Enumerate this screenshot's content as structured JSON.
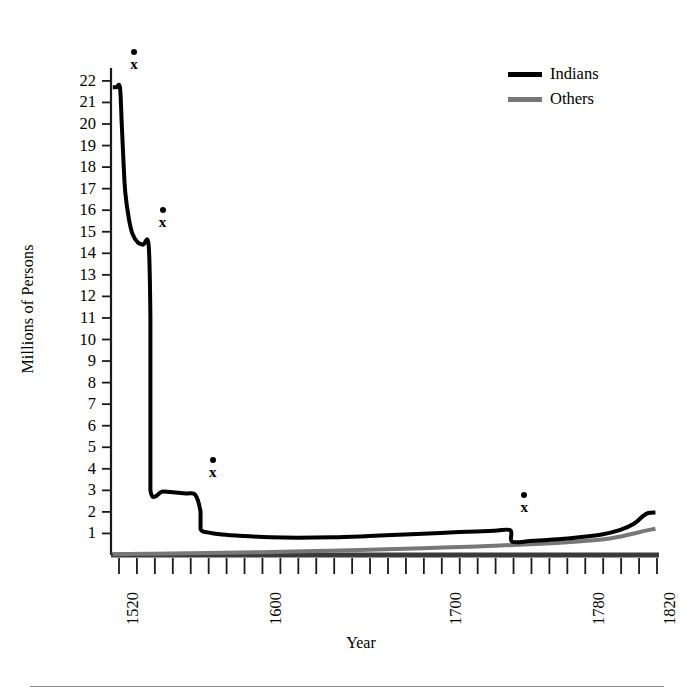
{
  "chart_data": {
    "type": "line",
    "title": "",
    "xlabel": "Year",
    "ylabel": "Millions of Persons",
    "xlim": [
      1516,
      1822
    ],
    "ylim": [
      0,
      22.6
    ],
    "grid": false,
    "legend_position": "top-right",
    "x_tick_labels": [
      "1520",
      "1600",
      "1700",
      "1780",
      "1820"
    ],
    "x_tick_values": [
      1520,
      1600,
      1700,
      1780,
      1820
    ],
    "y_tick_labels": [
      "1",
      "2",
      "3",
      "4",
      "5",
      "6",
      "7",
      "8",
      "9",
      "10",
      "11",
      "12",
      "13",
      "14",
      "15",
      "16",
      "17",
      "18",
      "19",
      "20",
      "21",
      "22"
    ],
    "y_tick_values": [
      1,
      2,
      3,
      4,
      5,
      6,
      7,
      8,
      9,
      10,
      11,
      12,
      13,
      14,
      15,
      16,
      17,
      18,
      19,
      20,
      21,
      22
    ],
    "minor_x_ticks_count": 31,
    "series": [
      {
        "name": "Indians",
        "color": "#000000",
        "width": 4,
        "points": [
          [
            1517,
            21.7
          ],
          [
            1519,
            21.7
          ],
          [
            1521,
            21.7
          ],
          [
            1522,
            20.0
          ],
          [
            1523,
            18.2
          ],
          [
            1524,
            16.8
          ],
          [
            1526,
            15.6
          ],
          [
            1528,
            14.9
          ],
          [
            1531,
            14.5
          ],
          [
            1534,
            14.4
          ],
          [
            1537,
            14.4
          ],
          [
            1538,
            11.0
          ],
          [
            1538,
            7.0
          ],
          [
            1538,
            3.0
          ],
          [
            1545,
            2.95
          ],
          [
            1552,
            2.9
          ],
          [
            1558,
            2.85
          ],
          [
            1563,
            2.8
          ],
          [
            1566,
            2.0
          ],
          [
            1566,
            1.2
          ],
          [
            1570,
            1.05
          ],
          [
            1578,
            0.95
          ],
          [
            1590,
            0.88
          ],
          [
            1605,
            0.82
          ],
          [
            1620,
            0.8
          ],
          [
            1640,
            0.82
          ],
          [
            1660,
            0.88
          ],
          [
            1680,
            0.95
          ],
          [
            1700,
            1.02
          ],
          [
            1715,
            1.08
          ],
          [
            1730,
            1.12
          ],
          [
            1739,
            1.15
          ],
          [
            1740,
            0.62
          ],
          [
            1750,
            0.65
          ],
          [
            1760,
            0.7
          ],
          [
            1775,
            0.8
          ],
          [
            1790,
            0.95
          ],
          [
            1800,
            1.15
          ],
          [
            1808,
            1.45
          ],
          [
            1813,
            1.8
          ],
          [
            1816,
            1.95
          ],
          [
            1820,
            1.97
          ]
        ]
      },
      {
        "name": "Others",
        "color": "#777777",
        "width": 4,
        "points": [
          [
            1517,
            0.03
          ],
          [
            1540,
            0.06
          ],
          [
            1570,
            0.09
          ],
          [
            1600,
            0.13
          ],
          [
            1630,
            0.18
          ],
          [
            1660,
            0.24
          ],
          [
            1690,
            0.31
          ],
          [
            1720,
            0.4
          ],
          [
            1750,
            0.5
          ],
          [
            1775,
            0.62
          ],
          [
            1790,
            0.72
          ],
          [
            1800,
            0.85
          ],
          [
            1808,
            1.0
          ],
          [
            1814,
            1.12
          ],
          [
            1820,
            1.22
          ]
        ]
      }
    ],
    "annotations": [
      {
        "label": "x",
        "marker": "dot-above-x",
        "x": 1521,
        "y": 21.7,
        "note": "epidemic event marker"
      },
      {
        "label": "x",
        "marker": "dot-above-x",
        "x": 1537,
        "y": 14.4,
        "note": "epidemic event marker"
      },
      {
        "label": "x",
        "marker": "dot-above-x",
        "x": 1565,
        "y": 2.8,
        "note": "epidemic event marker"
      },
      {
        "label": "x",
        "marker": "dot-above-x",
        "x": 1739,
        "y": 1.15,
        "note": "epidemic event marker"
      }
    ]
  },
  "legend": {
    "items": [
      {
        "label": "Indians",
        "color": "#000000"
      },
      {
        "label": "Others",
        "color": "#777777"
      }
    ]
  },
  "axes": {
    "x_title": "Year",
    "y_title": "Millions of Persons"
  }
}
